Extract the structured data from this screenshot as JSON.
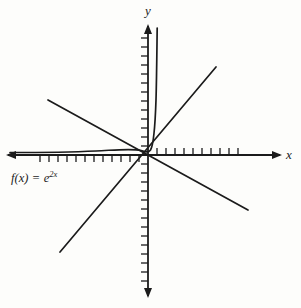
{
  "figure": {
    "kind": "cartesian-graph",
    "background_color": "#fdfdfb",
    "ink_color": "#1b1b1b",
    "width": 301,
    "height": 308
  },
  "axes": {
    "x_label": "x",
    "y_label": "y",
    "origin": {
      "x": 148,
      "y": 155
    },
    "x_axis": {
      "x_start": 6,
      "x_end": 282,
      "y": 155,
      "arrow_start": true,
      "arrow_end": true
    },
    "y_axis": {
      "y_start": 24,
      "y_end": 298,
      "x": 148,
      "arrow_start": true,
      "arrow_end": true
    },
    "tick_spacing": 9,
    "tick_length": 7,
    "ticks_x_left": 12,
    "ticks_x_right": 10,
    "ticks_y_up": 13,
    "ticks_y_down": 14
  },
  "function_label": {
    "prefix": "f",
    "argument": "(x)",
    "equals": " = ",
    "base": "e",
    "exponent": "2x",
    "full_text": "f(x) = e2x"
  },
  "chart_data": {
    "type": "line",
    "title": "",
    "xlabel": "x",
    "ylabel": "y",
    "grid": false,
    "legend": null,
    "xlim": [
      -15.5,
      14.5
    ],
    "ylim": [
      -15.5,
      14.5
    ],
    "annotations": [
      {
        "text": "f(x) = e^{2x}",
        "x": -13.5,
        "y": -2.5
      }
    ],
    "series": [
      {
        "name": "f(x) = e^{2x}",
        "type": "curve",
        "equation": "y = e^(2x)",
        "comment": "exponential curve: asymptotic to the negative x-axis, rises steeply just right of the origin",
        "points": [
          {
            "x": -15.5,
            "y": 0.0
          },
          {
            "x": -11.0,
            "y": 0.0
          },
          {
            "x": -7.0,
            "y": 0.05
          },
          {
            "x": -4.0,
            "y": 0.1
          },
          {
            "x": -2.0,
            "y": 0.25
          },
          {
            "x": -1.0,
            "y": 0.5
          },
          {
            "x": -0.3,
            "y": 1.1
          },
          {
            "x": 0.0,
            "y": 1.6
          },
          {
            "x": 0.5,
            "y": 3.5
          },
          {
            "x": 0.9,
            "y": 7.0
          },
          {
            "x": 1.1,
            "y": 10.5
          },
          {
            "x": 1.2,
            "y": 14.2
          }
        ]
      },
      {
        "name": "tangent-like increasing line",
        "type": "line",
        "comment": "straight line of positive slope through the origin",
        "points": [
          {
            "x": -9.8,
            "y": -10.8
          },
          {
            "x": 7.4,
            "y": 9.7
          }
        ]
      },
      {
        "name": "decreasing line",
        "type": "line",
        "comment": "straight line of negative slope through the origin",
        "points": [
          {
            "x": -11.1,
            "y": 6.1
          },
          {
            "x": 11.1,
            "y": -6.1
          }
        ]
      }
    ]
  }
}
